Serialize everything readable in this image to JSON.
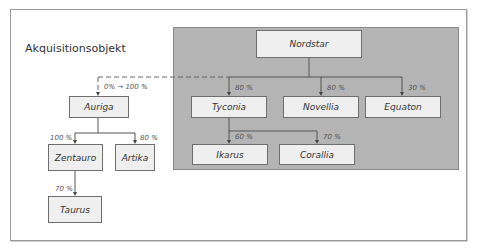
{
  "title": "Akquisitionsobjekt",
  "nodes": {
    "nordstar": "Nordstar",
    "tyconia": "Tyconia",
    "novellia": "Novellia",
    "equaton": "Equaton",
    "ikarus": "Ikarus",
    "corallia": "Corallia",
    "auriga": "Auriga",
    "zentauro": "Zentauro",
    "artika": "Artika",
    "taurus": "Taurus"
  },
  "percentages": {
    "auriga": "0% → 100 %",
    "tyconia": "80 %",
    "novellia": "80 %",
    "equaton": "30 %",
    "ikarus": "60 %",
    "corallia": "70 %",
    "zentauro": "100 %",
    "artika": "80 %",
    "taurus": "70 %"
  },
  "colors": {
    "panel": "#b4b4b4",
    "node_fill": "#efefef",
    "line": "#555555"
  }
}
